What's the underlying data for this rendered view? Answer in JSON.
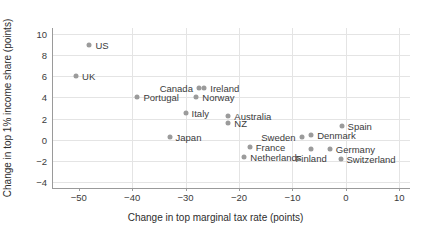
{
  "chart_data": {
    "type": "scatter",
    "title": "",
    "xlabel": "Change in top marginal tax rate (points)",
    "ylabel": "Change in top 1% income share (points)",
    "xlim": [
      -55,
      12
    ],
    "ylim": [
      -4.6,
      10.6
    ],
    "xticks": [
      -50,
      -40,
      -30,
      -20,
      -10,
      0,
      10
    ],
    "xtick_labels": [
      "−50",
      "−40",
      "−30",
      "−20",
      "−10",
      "0",
      "10"
    ],
    "yticks": [
      -4,
      -2,
      0,
      2,
      4,
      6,
      8,
      10
    ],
    "ytick_labels": [
      "−4",
      "−2",
      "0",
      "2",
      "4",
      "6",
      "8",
      "10"
    ],
    "grid": true,
    "legend": "none",
    "marker_color": "#9b9b9b",
    "points": [
      {
        "name": "US",
        "x": -48.0,
        "y": 9.0,
        "label_side": "right"
      },
      {
        "name": "UK",
        "x": -50.5,
        "y": 6.0,
        "label_side": "right"
      },
      {
        "name": "Canada",
        "x": -27.5,
        "y": 4.9,
        "label_side": "left"
      },
      {
        "name": "Ireland",
        "x": -26.5,
        "y": 4.9,
        "label_side": "right"
      },
      {
        "name": "Portugal",
        "x": -39.0,
        "y": 4.0,
        "label_side": "right"
      },
      {
        "name": "Norway",
        "x": -28.0,
        "y": 4.0,
        "label_side": "right"
      },
      {
        "name": "Italy",
        "x": -30.0,
        "y": 2.5,
        "label_side": "right"
      },
      {
        "name": "Australia",
        "x": -22.0,
        "y": 2.2,
        "label_side": "right"
      },
      {
        "name": "NZ",
        "x": -22.0,
        "y": 1.6,
        "label_side": "right"
      },
      {
        "name": "Spain",
        "x": -0.8,
        "y": 1.3,
        "label_side": "right"
      },
      {
        "name": "Denmark",
        "x": -6.5,
        "y": 0.4,
        "label_side": "right"
      },
      {
        "name": "Sweden",
        "x": -8.3,
        "y": 0.2,
        "label_side": "left"
      },
      {
        "name": "Japan",
        "x": -33.0,
        "y": 0.25,
        "label_side": "right"
      },
      {
        "name": "France",
        "x": -18.0,
        "y": -0.7,
        "label_side": "right"
      },
      {
        "name": "Germany",
        "x": -3.0,
        "y": -0.9,
        "label_side": "right"
      },
      {
        "name": "Finland",
        "x": -6.5,
        "y": -0.9,
        "label_side": "below"
      },
      {
        "name": "Netherlands",
        "x": -19.0,
        "y": -1.7,
        "label_side": "right"
      },
      {
        "name": "Switzerland",
        "x": -1.0,
        "y": -1.8,
        "label_side": "right"
      }
    ]
  }
}
